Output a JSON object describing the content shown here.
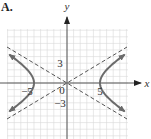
{
  "figure": {
    "panel_label": "A."
  },
  "chart_data": {
    "type": "line",
    "title": "",
    "panel_label": "A.",
    "equation": "x^2/25 - y^2/9 = 1",
    "xlabel": "x",
    "ylabel": "y",
    "xlim": [
      -9,
      9
    ],
    "ylim": [
      -8.5,
      8
    ],
    "grid": true,
    "grid_step": 1,
    "tick_labels": {
      "x": [
        {
          "value": -5,
          "label": "−5"
        },
        {
          "value": 5,
          "label": "5"
        }
      ],
      "y": [
        {
          "value": 3,
          "label": "3"
        },
        {
          "value": -3,
          "label": "−3"
        }
      ],
      "origin": "0"
    },
    "vertices": [
      [
        -5,
        0
      ],
      [
        5,
        0
      ]
    ],
    "asymptotes": [
      {
        "name": "y = (3/5)x",
        "slope": 0.6,
        "style": "dashed"
      },
      {
        "name": "y = -(3/5)x",
        "slope": -0.6,
        "style": "dashed"
      }
    ],
    "series": [
      {
        "name": "right branch",
        "a": 5,
        "b": 3,
        "side": 1,
        "y_range": [
          -4.3,
          4.3
        ],
        "arrows": true
      },
      {
        "name": "left branch",
        "a": 5,
        "b": 3,
        "side": -1,
        "y_range": [
          -4.3,
          4.3
        ],
        "arrows": true
      }
    ],
    "colors": {
      "curve": "#6b6b6b",
      "asymptote": "#555555",
      "axis": "#555555",
      "grid": "#d8d8d8"
    }
  }
}
